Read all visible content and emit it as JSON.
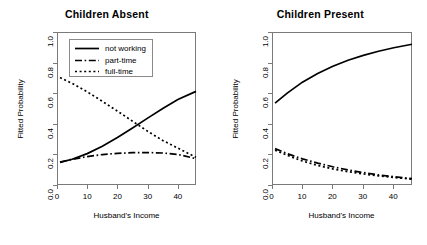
{
  "chart_data": [
    {
      "type": "line",
      "title": "Children Absent",
      "xlabel": "Husband's Income",
      "ylabel": "Fitted Probability",
      "xlim": [
        0,
        46
      ],
      "ylim": [
        0,
        1
      ],
      "xticks": [
        "0",
        "10",
        "20",
        "30",
        "40"
      ],
      "xtick_values": [
        0,
        10,
        20,
        30,
        40
      ],
      "yticks": [
        "0.0",
        "0.2",
        "0.4",
        "0.6",
        "0.8",
        "1.0"
      ],
      "ytick_values": [
        0.0,
        0.2,
        0.4,
        0.6,
        0.8,
        1.0
      ],
      "grid": false,
      "legend_position": "top-left",
      "x": [
        1,
        5,
        10,
        15,
        20,
        25,
        30,
        35,
        40,
        46
      ],
      "series": [
        {
          "name": "not working",
          "style": "solid",
          "values": [
            0.148,
            0.168,
            0.205,
            0.254,
            0.31,
            0.372,
            0.437,
            0.5,
            0.559,
            0.612
          ]
        },
        {
          "name": "part-time",
          "style": "dashdot",
          "values": [
            0.15,
            0.168,
            0.186,
            0.199,
            0.207,
            0.211,
            0.212,
            0.209,
            0.2,
            0.172
          ]
        },
        {
          "name": "full-time",
          "style": "dotted",
          "values": [
            0.702,
            0.664,
            0.609,
            0.547,
            0.483,
            0.417,
            0.351,
            0.291,
            0.241,
            0.181
          ]
        }
      ]
    },
    {
      "type": "line",
      "title": "Children Present",
      "xlabel": "Husband's Income",
      "ylabel": "Fitted Probability",
      "xlim": [
        0,
        46
      ],
      "ylim": [
        0,
        1
      ],
      "xticks": [
        "0",
        "10",
        "20",
        "30",
        "40"
      ],
      "xtick_values": [
        0,
        10,
        20,
        30,
        40
      ],
      "yticks": [
        "0.0",
        "0.2",
        "0.4",
        "0.6",
        "0.8",
        "1.0"
      ],
      "ytick_values": [
        0.0,
        0.2,
        0.4,
        0.6,
        0.8,
        1.0
      ],
      "grid": false,
      "legend_position": "none",
      "x": [
        1,
        5,
        10,
        15,
        20,
        25,
        30,
        35,
        40,
        46
      ],
      "series": [
        {
          "name": "not working",
          "style": "solid",
          "values": [
            0.535,
            0.601,
            0.672,
            0.729,
            0.776,
            0.815,
            0.847,
            0.874,
            0.897,
            0.92
          ]
        },
        {
          "name": "part-time",
          "style": "dashdot",
          "values": [
            0.238,
            0.205,
            0.171,
            0.143,
            0.119,
            0.098,
            0.081,
            0.066,
            0.054,
            0.042
          ]
        },
        {
          "name": "full-time",
          "style": "dotted",
          "values": [
            0.227,
            0.194,
            0.157,
            0.128,
            0.105,
            0.087,
            0.072,
            0.06,
            0.049,
            0.038
          ]
        }
      ]
    }
  ],
  "legend": {
    "items": [
      {
        "label": "not working",
        "style": "solid"
      },
      {
        "label": "part-time",
        "style": "dashdot"
      },
      {
        "label": "full-time",
        "style": "dotted"
      }
    ]
  },
  "colors": {
    "line": "#000000",
    "frame": "#7a7a7a",
    "background": "#ffffff",
    "text": "#000000"
  }
}
